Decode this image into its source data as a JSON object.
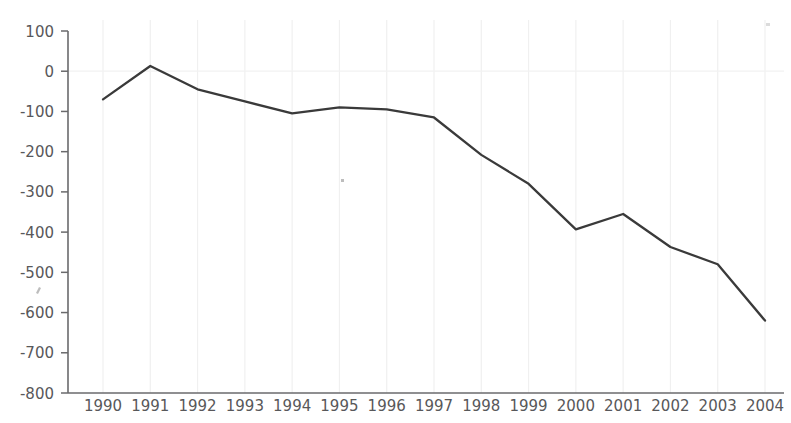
{
  "chart_data": {
    "type": "line",
    "title": "",
    "subtitle": "",
    "xlabel": "",
    "ylabel": "",
    "categories": [
      "1990",
      "1991",
      "1992",
      "1993",
      "1994",
      "1995",
      "1996",
      "1997",
      "1998",
      "1999",
      "2000",
      "2001",
      "2002",
      "2003",
      "2004"
    ],
    "x": [
      1990,
      1991,
      1992,
      1993,
      1994,
      1995,
      1996,
      1997,
      1998,
      1999,
      2000,
      2001,
      2002,
      2003,
      2004
    ],
    "values": [
      -70,
      13,
      -45,
      -75,
      -105,
      -90,
      -95,
      -115,
      -208,
      -280,
      -393,
      -355,
      -437,
      -480,
      -620
    ],
    "series": [
      {
        "name": "",
        "values": [
          -70,
          13,
          -45,
          -75,
          -105,
          -90,
          -95,
          -115,
          -208,
          -280,
          -393,
          -355,
          -437,
          -480,
          -620
        ],
        "color": "#3a3a3a"
      }
    ],
    "ylim": [
      -800,
      100
    ],
    "xlim": [
      1990,
      2004
    ],
    "ytick_labels": [
      "100",
      "0",
      "-100",
      "-200",
      "-300",
      "-400",
      "-500",
      "-600",
      "-700",
      "-800"
    ],
    "ytick_values": [
      100,
      0,
      -100,
      -200,
      -300,
      -400,
      -500,
      -600,
      -700,
      -800
    ],
    "xtick_labels": [
      "1990",
      "1991",
      "1992",
      "1993",
      "1994",
      "1995",
      "1996",
      "1997",
      "1998",
      "1999",
      "2000",
      "2001",
      "2002",
      "2003",
      "2004"
    ],
    "grid": {
      "vertical": true,
      "horizontal": false,
      "zero_line": true,
      "grid_color": "#f0f0f0"
    },
    "legend": {
      "visible": false,
      "position": "none",
      "entries": []
    },
    "annotations": [],
    "axis_color": "#6a6a6c",
    "label_color": "#58585a",
    "background_color": "#ffffff"
  }
}
